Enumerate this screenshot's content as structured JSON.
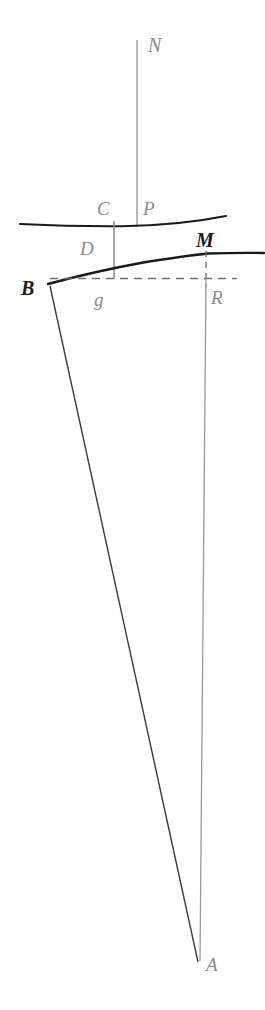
{
  "figure": {
    "width": 265,
    "height": 1010,
    "background_color": "#ffffff",
    "colors": {
      "curve_stroke": "#1a1a1a",
      "thin_line_stroke": "#4a4a4a",
      "faint_line_stroke": "#9a9a9a",
      "dashed_line_stroke": "#6f6f6f",
      "label_light": "#8b8b8b",
      "label_dark": "#1a1a1a"
    },
    "labels": [
      {
        "id": "label-N",
        "text": "N",
        "x": 148,
        "y": 35,
        "style": "light",
        "size": 20
      },
      {
        "id": "label-C",
        "text": "C",
        "x": 97,
        "y": 199,
        "style": "light",
        "size": 19
      },
      {
        "id": "label-P",
        "text": "P",
        "x": 143,
        "y": 199,
        "style": "light",
        "size": 19
      },
      {
        "id": "label-D",
        "text": "D",
        "x": 80,
        "y": 239,
        "style": "light",
        "size": 19
      },
      {
        "id": "label-M",
        "text": "M",
        "x": 196,
        "y": 230,
        "style": "dark",
        "size": 20
      },
      {
        "id": "label-B",
        "text": "B",
        "x": 21,
        "y": 278,
        "style": "dark",
        "size": 20
      },
      {
        "id": "label-g",
        "text": "g",
        "x": 94,
        "y": 290,
        "style": "light",
        "size": 19
      },
      {
        "id": "label-R",
        "text": "R",
        "x": 211,
        "y": 288,
        "style": "light",
        "size": 19
      },
      {
        "id": "label-A",
        "text": "A",
        "x": 206,
        "y": 955,
        "style": "light",
        "size": 19
      }
    ],
    "elements": {
      "vertical_N": "vertical line from N down to upper curve at P",
      "upper_curve": "shallow curve through C and P",
      "lower_curve": "bold curve from B rising through D to M",
      "segment_CD": "vertical segment from C down to dashed line at g",
      "dashed_horizontal": "dashed line from B through g to R",
      "dashed_vertical_M": "short dashed vertical from M down through R line",
      "vertical_RA": "long faint vertical from R down to A",
      "diagonal_BA": "long line from B down to A"
    }
  }
}
